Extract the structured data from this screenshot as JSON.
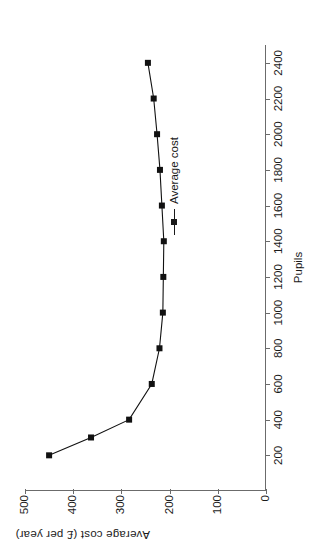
{
  "chart_data": {
    "type": "line",
    "title": "",
    "xlabel": "Pupils",
    "ylabel": "Average cost (£ per year)",
    "xlim": [
      0,
      2500
    ],
    "ylim": [
      0,
      500
    ],
    "xticks": [
      200,
      400,
      600,
      800,
      1000,
      1200,
      1400,
      1600,
      1800,
      2000,
      2200,
      2400
    ],
    "yticks": [
      0,
      100,
      200,
      300,
      400,
      500
    ],
    "xtick_labels": [
      "200",
      "400",
      "600",
      "800",
      "1000",
      "1200",
      "1400",
      "1600",
      "1800",
      "2000",
      "2200",
      "2400"
    ],
    "ytick_labels": [
      "0",
      "100",
      "200",
      "300",
      "400",
      "500"
    ],
    "grid": false,
    "legend_position": "center-right",
    "series": [
      {
        "name": "Average cost",
        "marker": "square",
        "color": "#111111",
        "x": [
          200,
          300,
          400,
          600,
          800,
          1000,
          1200,
          1400,
          1600,
          1800,
          2000,
          2200,
          2400
        ],
        "values": [
          450,
          363,
          284,
          237,
          221,
          214,
          213,
          212,
          216,
          220,
          226,
          233,
          245
        ]
      }
    ]
  },
  "legend": {
    "entries": [
      {
        "label": "Average cost"
      }
    ]
  },
  "axes": {
    "x_title": "Pupils",
    "y_title": "Average cost (£ per year)"
  }
}
